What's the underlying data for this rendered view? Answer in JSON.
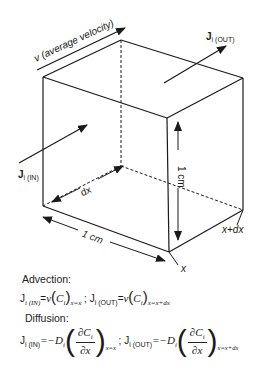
{
  "diagram": {
    "labels": {
      "velocity": "v (average velocity)",
      "j_out": "J",
      "j_out_sub": "i (OUT)",
      "j_in": "J",
      "j_in_sub": "i (IN)",
      "dx": "dx",
      "height": "1 cm",
      "depth": "1 cm",
      "x": "x",
      "x_plus_dx": "x+dx"
    },
    "colors": {
      "stroke": "#1a1a1a"
    }
  },
  "equations": {
    "advection": {
      "heading": "Advection:",
      "j_in_lhs": "J",
      "j_in_lhs_sub": "i (IN)",
      "v": "v",
      "c": "C",
      "c_sub": "i",
      "in_eval": "x=x",
      "sep": ";",
      "j_out_lhs": "J",
      "j_out_lhs_sub": "i (OUT)",
      "out_eval": "x=x+dx"
    },
    "diffusion": {
      "heading": "Diffusion:",
      "j_in_lhs": "J",
      "j_in_lhs_sub": "i (IN)",
      "neg_d": "=−D",
      "d_sub": "i",
      "num": "∂C",
      "num_sub": "i",
      "den": "∂x",
      "in_eval": "x=x",
      "sep": ";",
      "j_out_lhs": "J",
      "j_out_lhs_sub": "i (OUT)",
      "out_eval": "x=x+dx"
    }
  }
}
